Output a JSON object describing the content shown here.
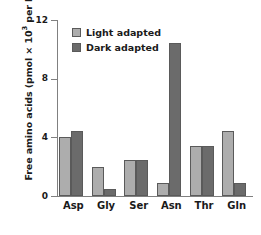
{
  "chart_data": {
    "type": "bar",
    "title": "",
    "xlabel": "",
    "ylabel": "Free amino acids (pmol × 10³ per leaf)",
    "ylabel_prefix": "Free amino acids (pmol × 10",
    "ylabel_exponent": "3",
    "ylabel_suffix": " per leaf)",
    "categories": [
      "Asp",
      "Gly",
      "Ser",
      "Asn",
      "Thr",
      "Gln"
    ],
    "series": [
      {
        "name": "Light adapted",
        "color": "#adadad",
        "values": [
          4.0,
          2.0,
          2.45,
          0.9,
          3.4,
          4.4
        ]
      },
      {
        "name": "Dark adapted",
        "color": "#6b6b6b",
        "values": [
          4.45,
          0.45,
          2.45,
          10.4,
          3.4,
          0.9
        ]
      }
    ],
    "ylim": [
      0,
      12
    ],
    "yticks": [
      0,
      4,
      8,
      12
    ],
    "ytick_labels": [
      "0",
      "4",
      "8",
      "12"
    ],
    "grid": false,
    "legend_position": "top-left-inside",
    "axis_color": "#808080",
    "bar_border_color": "#5a5a5a",
    "background": "#ffffff"
  },
  "legend": {
    "items": [
      {
        "label": "Light adapted",
        "color": "#adadad"
      },
      {
        "label": "Dark adapted",
        "color": "#6b6b6b"
      }
    ]
  }
}
